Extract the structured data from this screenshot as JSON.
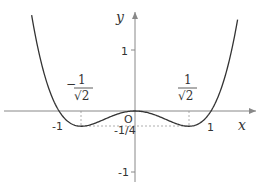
{
  "chart_data": {
    "type": "line",
    "title": "",
    "function": "y = x^4 - x^2",
    "xlabel": "x",
    "ylabel": "y",
    "xlim": [
      -1.36,
      1.55
    ],
    "ylim": [
      -1.2,
      1.8
    ],
    "grid": false,
    "x_ticks": [
      {
        "value": -1,
        "label": "-1"
      },
      {
        "value": 1,
        "label": "1"
      }
    ],
    "y_ticks": [
      {
        "value": 1,
        "label": "1"
      },
      {
        "value": -0.25,
        "label": "-1/4"
      },
      {
        "value": -1,
        "label": "-1"
      }
    ],
    "origin_label": "O",
    "annotations": [
      {
        "x": -0.7071,
        "label": "-1/√2",
        "numerator": "1",
        "denominator": "√2",
        "sign": "−"
      },
      {
        "x": 0.7071,
        "label": "1/√2",
        "numerator": "1",
        "denominator": "√2",
        "sign": ""
      }
    ],
    "key_points": [
      {
        "x": -1,
        "y": 0
      },
      {
        "x": -0.7071,
        "y": -0.25
      },
      {
        "x": 0,
        "y": 0
      },
      {
        "x": 0.7071,
        "y": -0.25
      },
      {
        "x": 1,
        "y": 0
      }
    ],
    "series": [
      {
        "name": "f(x)",
        "x": [
          -1.35,
          -1.2,
          -1.0,
          -0.85,
          -0.7071,
          -0.5,
          -0.25,
          0,
          0.25,
          0.5,
          0.7071,
          0.85,
          1.0,
          1.2,
          1.35
        ],
        "values": [
          1.497,
          0.634,
          0.0,
          -0.1997,
          -0.25,
          -0.1875,
          -0.0586,
          0,
          -0.0586,
          -0.1875,
          -0.25,
          -0.1997,
          0.0,
          0.634,
          1.497
        ]
      }
    ]
  },
  "labels": {
    "x_axis": "x",
    "y_axis": "y",
    "origin": "O",
    "tick_y_1": "1",
    "tick_y_neg1": "-1",
    "tick_y_min": "-1/4",
    "tick_x_neg1": "-1",
    "tick_x_1": "1",
    "frac_left_sign": "−",
    "frac_left_num": "1",
    "frac_left_den": "√2",
    "frac_right_num": "1",
    "frac_right_den": "√2"
  },
  "colors": {
    "curve": "#333333",
    "axis": "#888888",
    "dashed": "#999999"
  }
}
